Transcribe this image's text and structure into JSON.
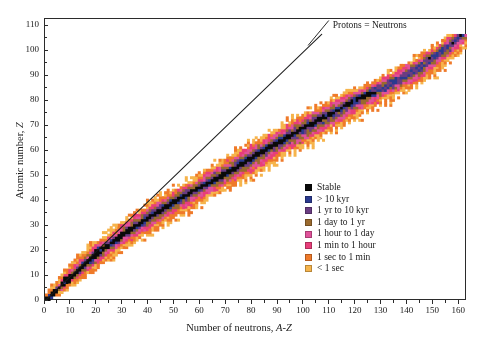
{
  "chart_data": {
    "type": "heatmap",
    "title": "",
    "xlabel": "Number of neutrons, A-Z",
    "xlabel_main": "Number of neutrons, ",
    "xlabel_italic": "A-Z",
    "ylabel": "Atomic number, Z",
    "ylabel_main": "Atomic number, ",
    "ylabel_italic": "Z",
    "xlim": [
      0,
      163
    ],
    "ylim": [
      0,
      113
    ],
    "xticks": [
      0,
      10,
      20,
      30,
      40,
      50,
      60,
      70,
      80,
      90,
      100,
      110,
      120,
      130,
      140,
      150,
      160
    ],
    "yticks": [
      0,
      10,
      20,
      30,
      40,
      50,
      60,
      70,
      80,
      90,
      100,
      110
    ],
    "grid": false,
    "legend_position": "inside-right",
    "annotations": [
      {
        "text": "Protons = Neutrons",
        "x": 112,
        "y": 110,
        "line_from": [
          102,
          102
        ],
        "line_to": [
          110,
          112
        ]
      }
    ],
    "reference_line": {
      "name": "N = Z line",
      "from": [
        0,
        0
      ],
      "to": [
        107,
        107
      ]
    },
    "categories": [
      "Stable",
      "> 10 kyr",
      "1 yr to 10 kyr",
      "1 day to 1 yr",
      "1 hour to 1 day",
      "1 min to 1 hour",
      "1 sec to 1 min",
      "< 1 sec"
    ],
    "colors": [
      "#0a0a0a",
      "#2b3a8f",
      "#6a3d82",
      "#9a6a2e",
      "#e0529a",
      "#e83e7a",
      "#ef7a2a",
      "#f6b44c"
    ],
    "valley_anchors": [
      {
        "z": 0,
        "n": 0
      },
      {
        "z": 8,
        "n": 8
      },
      {
        "z": 20,
        "n": 21
      },
      {
        "z": 28,
        "n": 32
      },
      {
        "z": 40,
        "n": 50
      },
      {
        "z": 50,
        "n": 68
      },
      {
        "z": 60,
        "n": 84
      },
      {
        "z": 70,
        "n": 101
      },
      {
        "z": 80,
        "n": 119
      },
      {
        "z": 90,
        "n": 139
      },
      {
        "z": 100,
        "n": 153
      },
      {
        "z": 106,
        "n": 160
      }
    ],
    "band_half_widths": [
      {
        "z": 0,
        "w": 1.2
      },
      {
        "z": 10,
        "w": 4.0
      },
      {
        "z": 20,
        "w": 6.0
      },
      {
        "z": 30,
        "w": 7.5
      },
      {
        "z": 40,
        "w": 8.5
      },
      {
        "z": 50,
        "w": 9.5
      },
      {
        "z": 60,
        "w": 10.0
      },
      {
        "z": 70,
        "w": 10.5
      },
      {
        "z": 80,
        "w": 10.0
      },
      {
        "z": 90,
        "w": 8.0
      },
      {
        "z": 100,
        "w": 6.0
      },
      {
        "z": 106,
        "w": 4.0
      }
    ],
    "stable_half_width": 0.9,
    "max_z": 106,
    "cell_size_n": 1,
    "cell_size_z": 1
  },
  "legend": {
    "items": [
      {
        "label": "Stable",
        "color": "#0a0a0a"
      },
      {
        "label": "> 10 kyr",
        "color": "#2b3a8f"
      },
      {
        "label": "1 yr to 10 kyr",
        "color": "#6a3d82"
      },
      {
        "label": "1 day to 1 yr",
        "color": "#9a6a2e"
      },
      {
        "label": "1 hour to 1 day",
        "color": "#e0529a"
      },
      {
        "label": "1 min to 1 hour",
        "color": "#e83e7a"
      },
      {
        "label": "1 sec to 1 min",
        "color": "#ef7a2a"
      },
      {
        "label": "< 1 sec",
        "color": "#f6b44c"
      }
    ]
  },
  "axes": {
    "x_title_plain": "Number of neutrons, ",
    "x_title_italic": "A-Z",
    "y_title_plain": "Atomic number, ",
    "y_title_italic": "Z"
  },
  "annotation": {
    "label": "Protons = Neutrons"
  }
}
